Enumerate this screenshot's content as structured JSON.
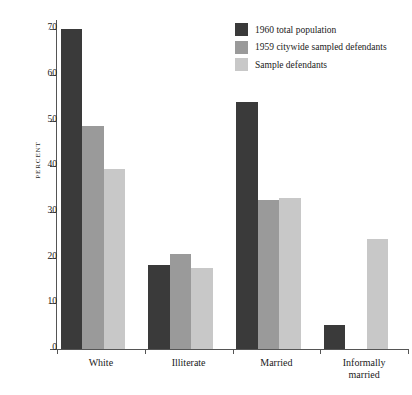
{
  "chart_data": {
    "type": "bar",
    "title": "",
    "xlabel": "",
    "ylabel": "PERCENT",
    "ylim": [
      0,
      72
    ],
    "yticks": [
      0,
      10,
      20,
      30,
      40,
      50,
      60,
      70
    ],
    "grid": false,
    "legend_position": "top-right",
    "categories": [
      "White",
      "Illiterate",
      "Married",
      "Informally married"
    ],
    "category_lines": [
      [
        "White"
      ],
      [
        "Illiterate"
      ],
      [
        "Married"
      ],
      [
        "Informally",
        "married"
      ]
    ],
    "series": [
      {
        "name": "1960 total population",
        "color": "#3a3a3a",
        "values": [
          70,
          18.3,
          54,
          5.2
        ]
      },
      {
        "name": "1959 citywide sampled defendants",
        "color": "#9a9a9a",
        "values": [
          48.8,
          20.8,
          32.6,
          0
        ]
      },
      {
        "name": "Sample defendants",
        "color": "#c8c8c8",
        "values": [
          39.3,
          17.8,
          33,
          24
        ]
      }
    ]
  },
  "axis": {
    "y_title": "PERCENT",
    "y_tick_labels": [
      "0",
      "10",
      "20",
      "30",
      "40",
      "50",
      "60",
      "70"
    ]
  },
  "legend": {
    "items": [
      {
        "label": "1960 total population",
        "color": "#3a3a3a"
      },
      {
        "label": "1959 citywide sampled defendants",
        "color": "#9a9a9a"
      },
      {
        "label": "Sample defendants",
        "color": "#c8c8c8"
      }
    ]
  }
}
